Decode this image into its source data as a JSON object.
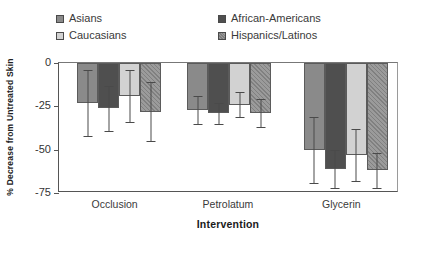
{
  "chart_data": {
    "type": "bar",
    "title": "",
    "xlabel": "Intervention",
    "ylabel": "% Decrease from Untreated Skin",
    "categories": [
      "Occlusion",
      "Petrolatum",
      "Glycerin"
    ],
    "ylim": [
      -75,
      0
    ],
    "yticks": [
      0,
      -25,
      -50,
      -75
    ],
    "ytick_labels": [
      "0",
      "-25",
      "-50",
      "-75"
    ],
    "grid": false,
    "legend_position": "top",
    "orientation": "vertical-negative",
    "series": [
      {
        "name": "Asians",
        "color": "#8a8a8a",
        "pattern": "solid-medium-gray",
        "values": [
          -23,
          -27,
          -50
        ],
        "err_low": [
          -42,
          -35,
          -69
        ],
        "err_high": [
          -4,
          -19,
          -31
        ]
      },
      {
        "name": "African-Americans",
        "color": "#4f4f4f",
        "pattern": "solid-dark-gray",
        "values": [
          -26,
          -29,
          -61
        ],
        "err_low": [
          -39,
          -35,
          -72
        ],
        "err_high": [
          -13,
          -23,
          -50
        ]
      },
      {
        "name": "Caucasians",
        "color": "#d2d2d2",
        "pattern": "solid-light-gray",
        "values": [
          -19,
          -24,
          -53
        ],
        "err_low": [
          -34,
          -31,
          "-68"
        ],
        "err_high": [
          -4,
          -17,
          -38
        ]
      },
      {
        "name": "Hispanics/Latinos",
        "color": "#9b9b9b",
        "pattern": "hatched-gray",
        "values": [
          -28,
          -29,
          -62
        ],
        "err_low": [
          -45,
          -37,
          -72
        ],
        "err_high": [
          -11,
          -21,
          -52
        ]
      }
    ]
  },
  "legend": {
    "items": [
      {
        "label": "Asians",
        "color": "#8a8a8a"
      },
      {
        "label": "African-Americans",
        "color": "#4f4f4f"
      },
      {
        "label": "Caucasians",
        "color": "#d2d2d2"
      },
      {
        "label": "Hispanics/Latinos",
        "color": "#9b9b9b"
      }
    ]
  },
  "axis": {
    "y_title": "% Decrease from Untreated Skin",
    "x_title": "Intervention",
    "y_labels": [
      "0",
      "-25",
      "-50",
      "-75"
    ],
    "x_labels": [
      "Occlusion",
      "Petrolatum",
      "Glycerin"
    ]
  }
}
